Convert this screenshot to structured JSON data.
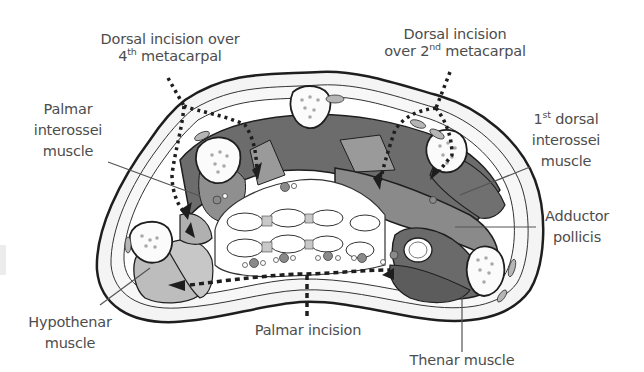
{
  "figure": {
    "colors": {
      "outline": "#1e1e1e",
      "skin": "#f2f2f2",
      "dark_muscle": "#6a6a6a",
      "mid_muscle": "#8f8f8f",
      "light_muscle": "#b9b9b9",
      "bone": "#fbfbfb",
      "bone_dots": "#a9a9a9",
      "label_text": "#4d4d4d",
      "leader_line": "#555555"
    }
  },
  "labels": {
    "dorsal_4th": {
      "line1": "Dorsal incision over",
      "line2_num": "4",
      "line2_sup": "th",
      "line2_rest": " metacarpal"
    },
    "dorsal_2nd": {
      "line1": "Dorsal incision",
      "line2_pre": "over 2",
      "line2_sup": "nd",
      "line2_rest": " metacarpal"
    },
    "palmar_interossei": {
      "line1": "Palmar",
      "line2": "interossei",
      "line3": "muscle"
    },
    "first_dorsal_interossei": {
      "line1_num": "1",
      "line1_sup": "st",
      "line1_rest": " dorsal",
      "line2": "interossei",
      "line3": "muscle"
    },
    "adductor_pollicis": {
      "line1": "Adductor",
      "line2": "pollicis"
    },
    "hypothenar": {
      "line1": "Hypothenar",
      "line2": "muscle"
    },
    "palmar_incision": {
      "line1": "Palmar incision"
    },
    "thenar": {
      "line1": "Thenar muscle"
    }
  },
  "incisions": [
    {
      "name": "Dorsal incision over 4th metacarpal",
      "style": "dotted"
    },
    {
      "name": "Dorsal incision over 2nd metacarpal",
      "style": "dotted"
    },
    {
      "name": "Palmar incision",
      "style": "dashed"
    }
  ]
}
